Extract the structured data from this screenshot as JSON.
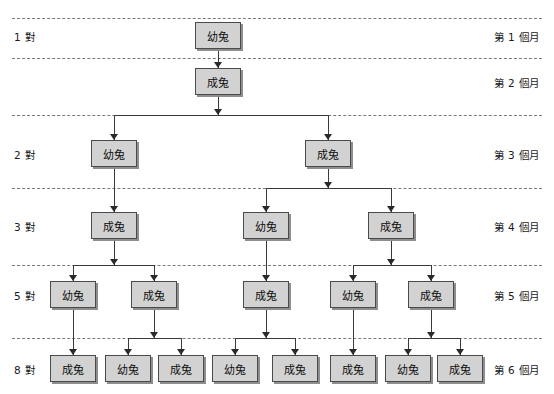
{
  "diagram": {
    "colors": {
      "node_fill": "#d2d2d2",
      "node_border": "#4a4a4a",
      "connector": "#3a3a3a",
      "divider": "#7a7a7a",
      "background": "#ffffff"
    },
    "labels": {
      "young": "幼兔",
      "adult": "成兔"
    }
  },
  "rows": [
    {
      "index": 0,
      "left_label": "1 對",
      "right_label": "第 1 個月",
      "top": 18,
      "bottom": 58,
      "node_y": 22,
      "nodes": [
        {
          "kind": "young",
          "text": "幼兔",
          "x": 195
        }
      ]
    },
    {
      "index": 1,
      "left_label": "",
      "right_label": "第 2 個月",
      "top": 58,
      "bottom": 115,
      "node_y": 68,
      "nodes": [
        {
          "kind": "adult",
          "text": "成兔",
          "x": 195
        }
      ]
    },
    {
      "index": 2,
      "left_label": "2 對",
      "right_label": "第 3 個月",
      "top": 115,
      "bottom": 188,
      "node_y": 140,
      "nodes": [
        {
          "kind": "young",
          "text": "幼兔",
          "x": 91
        },
        {
          "kind": "adult",
          "text": "成兔",
          "x": 305
        }
      ]
    },
    {
      "index": 3,
      "left_label": "3 對",
      "right_label": "第 4 個月",
      "top": 188,
      "bottom": 265,
      "node_y": 212,
      "nodes": [
        {
          "kind": "adult",
          "text": "成兔",
          "x": 91
        },
        {
          "kind": "young",
          "text": "幼兔",
          "x": 243
        },
        {
          "kind": "adult",
          "text": "成兔",
          "x": 368
        }
      ]
    },
    {
      "index": 4,
      "left_label": "5 對",
      "right_label": "第 5 個月",
      "top": 265,
      "bottom": 338,
      "node_y": 281,
      "nodes": [
        {
          "kind": "young",
          "text": "幼兔",
          "x": 50
        },
        {
          "kind": "adult",
          "text": "成兔",
          "x": 131
        },
        {
          "kind": "adult",
          "text": "成兔",
          "x": 243
        },
        {
          "kind": "young",
          "text": "幼兔",
          "x": 330
        },
        {
          "kind": "adult",
          "text": "成兔",
          "x": 408
        }
      ]
    },
    {
      "index": 5,
      "left_label": "8 對",
      "right_label": "第 6 個月",
      "top": 338,
      "bottom": 394,
      "node_y": 355,
      "nodes": [
        {
          "kind": "adult",
          "text": "成兔",
          "x": 50
        },
        {
          "kind": "young",
          "text": "幼兔",
          "x": 105
        },
        {
          "kind": "adult",
          "text": "成兔",
          "x": 158
        },
        {
          "kind": "young",
          "text": "幼兔",
          "x": 212
        },
        {
          "kind": "adult",
          "text": "成兔",
          "x": 272
        },
        {
          "kind": "adult",
          "text": "成兔",
          "x": 330
        },
        {
          "kind": "young",
          "text": "幼兔",
          "x": 385
        },
        {
          "kind": "adult",
          "text": "成兔",
          "x": 437
        }
      ]
    }
  ],
  "sequence": {
    "pairs": [
      "1 對",
      "2 對",
      "3 對",
      "5 對",
      "8 對"
    ],
    "months": [
      "第 1 個月",
      "第 2 個月",
      "第 3 個月",
      "第 4 個月",
      "第 5 個月",
      "第 6 個月"
    ]
  }
}
